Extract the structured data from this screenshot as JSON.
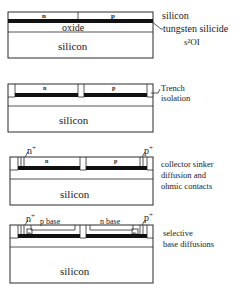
{
  "colors": {
    "line": "#2a2a2a",
    "silicide": "#111111",
    "background": "#ffffff"
  },
  "panels": [
    {
      "step": 1,
      "layers": {
        "n": "n",
        "p": "p",
        "oxide": "oxide",
        "substrate": "silicon"
      },
      "annotations": {
        "top": "silicon",
        "middle": "tungsten silicide",
        "bottom": "s²OI"
      }
    },
    {
      "step": 2,
      "layers": {
        "n": "n",
        "p": "p",
        "substrate": "silicon"
      },
      "annotations": {
        "line1": "Trench",
        "line2": "isolation"
      }
    },
    {
      "step": 3,
      "layers": {
        "n": "n",
        "p": "p",
        "n_plus": "n",
        "p_plus": "p",
        "sup": "+",
        "substrate": "silicon"
      },
      "annotations": {
        "line1": "collector sinker",
        "line2": "diffusion and",
        "line3": "ohmic contacts"
      }
    },
    {
      "step": 4,
      "layers": {
        "p_base": "p base",
        "n_base": "n base",
        "n_plus": "n",
        "p_plus": "p",
        "sup": "+",
        "small_n": "n",
        "small_p": "p",
        "substrate": "silicon"
      },
      "annotations": {
        "line1": "selective",
        "line2": "base diffusions"
      }
    }
  ]
}
